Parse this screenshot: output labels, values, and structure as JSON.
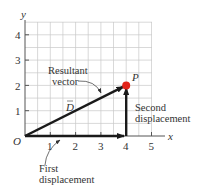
{
  "diagram": {
    "title": "",
    "axes": {
      "x_label": "x",
      "y_label": "y",
      "origin_label": "O",
      "x_ticks": [
        "1",
        "2",
        "3",
        "4",
        "5"
      ],
      "y_ticks": [
        "1",
        "2",
        "3",
        "4"
      ],
      "x_range": [
        0,
        5.5
      ],
      "y_range": [
        0,
        4.5
      ],
      "grid_spacing": 0.5
    },
    "vectors": [
      {
        "id": "first",
        "from": [
          0,
          0
        ],
        "to": [
          4,
          0
        ],
        "label_line1": "First",
        "label_line2": "displacement"
      },
      {
        "id": "second",
        "from": [
          4,
          0
        ],
        "to": [
          4,
          2
        ],
        "label_line1": "Second",
        "label_line2": "displacement"
      },
      {
        "id": "resultant",
        "from": [
          0,
          0
        ],
        "to": [
          4,
          2
        ],
        "label_line1": "Resultant",
        "label_line2": "vector",
        "symbol": "D"
      }
    ],
    "point": {
      "label": "P",
      "coords": [
        4,
        2
      ],
      "color": "#e2231a"
    },
    "colors": {
      "grid": "#c8c8c8",
      "axis": "#555555",
      "vector": "#1a1a1a",
      "text": "#333333"
    }
  }
}
